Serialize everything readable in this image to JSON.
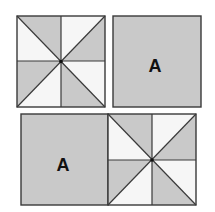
{
  "figure": {
    "colors": {
      "gray": "#c9c9c9",
      "white": "#f6f6f6",
      "line": "#3a3a3a",
      "text": "#111111"
    },
    "tiles": [
      {
        "type": "pinwheel",
        "position": "top-left"
      },
      {
        "type": "plain",
        "position": "top-right",
        "label": "A"
      },
      {
        "type": "plain",
        "position": "bottom-left",
        "label": "A"
      },
      {
        "type": "pinwheel",
        "position": "bottom-right"
      }
    ]
  }
}
